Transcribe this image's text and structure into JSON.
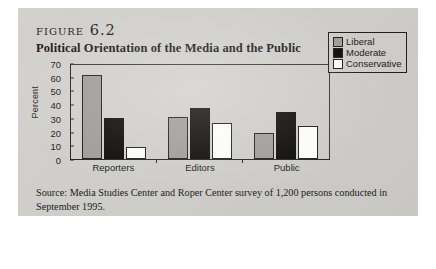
{
  "figure": {
    "label": "figure 6.2",
    "subtitle": "Political Orientation of the Media and the Public",
    "source": "Source: Media Studies Center and Roper Center survey of 1,200 persons conducted in September 1995."
  },
  "legend": {
    "items": [
      {
        "label": "Liberal",
        "color": "#9d9c98",
        "swatch": "liberal"
      },
      {
        "label": "Moderate",
        "color": "#0c0b0a",
        "swatch": "moderate"
      },
      {
        "label": "Conservative",
        "color": "#fbfbf9",
        "swatch": "conservative"
      }
    ]
  },
  "chart_data": {
    "type": "bar",
    "title": "Political Orientation of the Media and the Public",
    "xlabel": "",
    "ylabel": "Percent",
    "ylim": [
      0,
      70
    ],
    "yticks": [
      0,
      10,
      20,
      30,
      40,
      50,
      60,
      70
    ],
    "grid": false,
    "legend_position": "right",
    "categories": [
      "Reporters",
      "Editors",
      "Public"
    ],
    "series": [
      {
        "name": "Liberal",
        "color": "#9d9c98",
        "values": [
          61,
          31,
          19
        ]
      },
      {
        "name": "Moderate",
        "color": "#0c0b0a",
        "values": [
          30,
          37,
          34
        ]
      },
      {
        "name": "Conservative",
        "color": "#fbfbf9",
        "values": [
          9,
          26,
          24
        ]
      }
    ]
  }
}
